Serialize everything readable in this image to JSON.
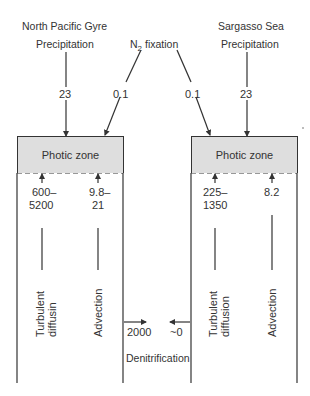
{
  "left_system": {
    "title": "North Pacific Gyre",
    "precipitation_label": "Precipitation",
    "precipitation_value": "23",
    "n2_fixation_value": "0.1",
    "photic_zone_label": "Photic zone",
    "turbulent_value_line1": "600–",
    "turbulent_value_line2": "5200",
    "advection_value_line1": "9.8–",
    "advection_value_line2": "21",
    "turbulent_label_line1": "Turbulent",
    "turbulent_label_line2": "diffusin",
    "advection_label": "Advection",
    "denitrification_value": "2000"
  },
  "right_system": {
    "title": "Sargasso Sea",
    "precipitation_label": "Precipitation",
    "precipitation_value": "23",
    "n2_fixation_value": "0.1",
    "photic_zone_label": "Photic zone",
    "turbulent_value_line1": "225–",
    "turbulent_value_line2": "1350",
    "advection_value": "8.2",
    "turbulent_label_line1": "Turbulent",
    "turbulent_label_line2": "diffusion",
    "advection_label": "Advection",
    "denitrification_value": "~0"
  },
  "shared": {
    "n2_fixation_label_main": "N",
    "n2_fixation_subscript": "2",
    "n2_fixation_label_rest": " fixation",
    "denitrification_label": "Denitrification"
  },
  "colors": {
    "line": "#333333",
    "photic_fill": "#dedede",
    "background": "#ffffff"
  }
}
